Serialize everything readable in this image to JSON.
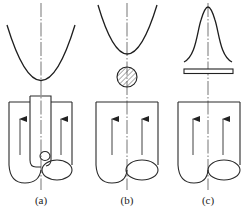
{
  "figure": {
    "panels": [
      {
        "id": "a",
        "label": "(a)",
        "profile": "parabola-wide",
        "insert": "tube",
        "description": "Parabolic profile above container with a central tube inserted from top"
      },
      {
        "id": "b",
        "label": "(b)",
        "profile": "parabola-narrow",
        "insert": "hatched-circle",
        "description": "Parabolic profile above a hatched circular cross-section"
      },
      {
        "id": "c",
        "label": "(c)",
        "profile": "bell-curve",
        "insert": "flat-plate",
        "description": "Bell-shaped profile above a flat rectangular plate"
      }
    ],
    "colors": {
      "stroke": "#2a2a2a",
      "background": "#ffffff"
    }
  }
}
